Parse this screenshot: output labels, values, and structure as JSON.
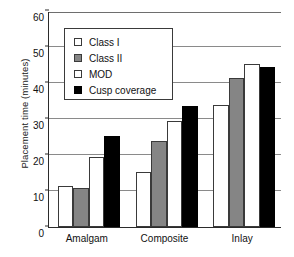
{
  "chart_data": {
    "type": "bar",
    "title": "",
    "xlabel": "",
    "ylabel": "Placement time (minutes)",
    "ylim": [
      0,
      60
    ],
    "yticks": [
      0,
      10,
      20,
      30,
      40,
      50,
      60
    ],
    "ytick_labels": [
      "0",
      "10",
      "20",
      "30",
      "40",
      "50",
      "60"
    ],
    "grid": "horizontal",
    "legend_position": "upper-left-inside",
    "categories": [
      "Amalgam",
      "Composite",
      "Inlay"
    ],
    "series": [
      {
        "name": "Class I",
        "color": "#ffffff",
        "values": [
          11.3,
          15.3,
          34.0
        ]
      },
      {
        "name": "Class II",
        "color": "#858585",
        "values": [
          10.8,
          24.0,
          41.5
        ]
      },
      {
        "name": "MOD",
        "color": "#ffffff",
        "values": [
          19.5,
          29.5,
          45.3
        ]
      },
      {
        "name": "Cusp coverage",
        "color": "#000000",
        "values": [
          25.3,
          33.5,
          44.5
        ]
      }
    ]
  }
}
